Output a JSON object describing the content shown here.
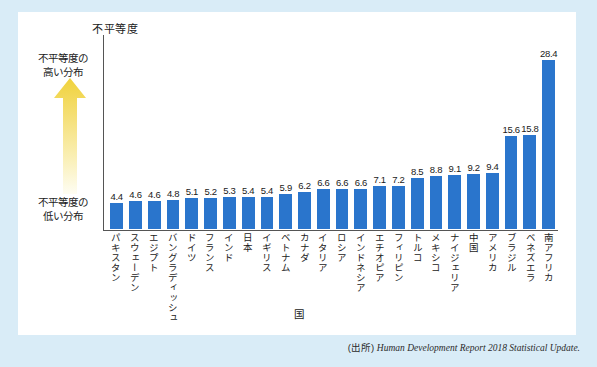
{
  "figure": {
    "background_color": "#d9ecf7",
    "card_color": "#ffffff",
    "bar_color": "#2a75cc",
    "axis_color": "#555555",
    "arrow_color_top": "#f0d23c",
    "arrow_color_bottom": "#fdfbe8"
  },
  "annotations": {
    "high_line1": "不平等度の",
    "high_line2": "高い分布",
    "low_line1": "不平等度の",
    "low_line2": "低い分布",
    "arrow_name": "up-arrow-gradient"
  },
  "source": {
    "prefix": "(出所) ",
    "text": "Human Development Report 2018 Statistical Update."
  },
  "chart_data": {
    "type": "bar",
    "title": "",
    "xlabel": "国",
    "ylabel": "不平等度",
    "ylim": [
      0,
      30
    ],
    "grid": false,
    "legend": "none",
    "orientation": "vertical",
    "categories": [
      "パキスタン",
      "スウェーデン",
      "エジプト",
      "バングラディッシュ",
      "ドイツ",
      "フランス",
      "インド",
      "日本",
      "イギリス",
      "ベトナム",
      "カナダ",
      "イタリア",
      "ロシア",
      "インドネシア",
      "エチオピア",
      "フィリピン",
      "トルコ",
      "メキシコ",
      "ナイジェリア",
      "中国",
      "アメリカ",
      "ブラジル",
      "ベネズエラ",
      "南アフリカ"
    ],
    "values": [
      4.4,
      4.6,
      4.6,
      4.8,
      5.1,
      5.2,
      5.3,
      5.4,
      5.4,
      5.9,
      6.2,
      6.6,
      6.6,
      6.6,
      7.1,
      7.2,
      8.5,
      8.8,
      9.1,
      9.2,
      9.4,
      15.6,
      15.8,
      28.4
    ],
    "value_labels": [
      "4.4",
      "4.6",
      "4.6",
      "4.8",
      "5.1",
      "5.2",
      "5.3",
      "5.4",
      "5.4",
      "5.9",
      "6.2",
      "6.6",
      "6.6",
      "6.6",
      "7.1",
      "7.2",
      "8.5",
      "8.8",
      "9.1",
      "9.2",
      "9.4",
      "15.6",
      "15.8",
      "28.4"
    ]
  }
}
